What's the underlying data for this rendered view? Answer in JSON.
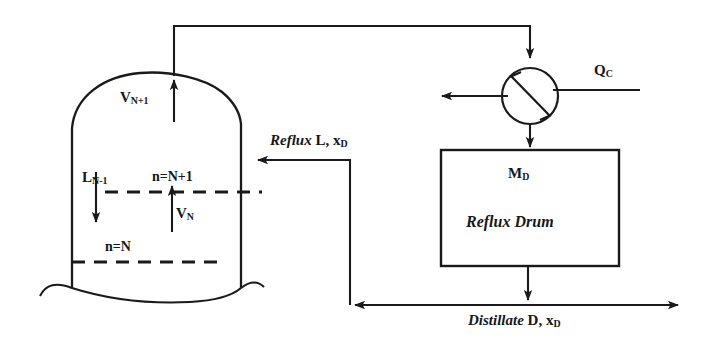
{
  "diagram": {
    "type": "process-flow-diagram",
    "stroke_color": "#1a1a1a",
    "background_color": "#ffffff"
  },
  "labels": {
    "vapor_to_condenser": "V",
    "vapor_to_condenser_sub": "N+1",
    "liquid_down": "L",
    "liquid_down_sub": "N-1",
    "stage_n_plus_1": "n=N+1",
    "vapor_n": "V",
    "vapor_n_sub": "N",
    "stage_n": "n=N",
    "reflux_word": "Reflux",
    "reflux_stream": "L, x",
    "reflux_stream_sub": "D",
    "condenser_duty": "Q",
    "condenser_duty_sub": "C",
    "drum_holdup": "M",
    "drum_holdup_sub": "D",
    "drum_name": "Reflux Drum",
    "distillate_word": "Distillate",
    "distillate_stream": "D, x",
    "distillate_stream_sub": "D"
  },
  "components": {
    "column": "distillation-column",
    "condenser": "condenser-symbol",
    "reflux_drum": "reflux-drum-vessel"
  },
  "streams": [
    {
      "name": "vapor-overhead-line",
      "from": "column-top",
      "to": "condenser",
      "label": "V N+1"
    },
    {
      "name": "condenser-vent-line",
      "from": "condenser",
      "to": "left-outlet",
      "label": ""
    },
    {
      "name": "condenser-duty-line",
      "from": "right",
      "to": "condenser",
      "label": "Q C"
    },
    {
      "name": "condensate-line",
      "from": "condenser",
      "to": "reflux-drum",
      "label": ""
    },
    {
      "name": "drum-outlet-line",
      "from": "reflux-drum",
      "to": "split-tee",
      "label": ""
    },
    {
      "name": "reflux-return-line",
      "from": "split-tee",
      "to": "column",
      "label": "Reflux L, xD"
    },
    {
      "name": "distillate-product-line",
      "from": "split-tee",
      "to": "right-outlet",
      "label": "Distillate D, xD"
    },
    {
      "name": "internal-liquid-downflow",
      "from": "stage-N+1",
      "to": "stage-N",
      "label": "L N-1"
    },
    {
      "name": "internal-vapor-upflow",
      "from": "stage-N",
      "to": "stage-N+1",
      "label": "V N"
    }
  ]
}
